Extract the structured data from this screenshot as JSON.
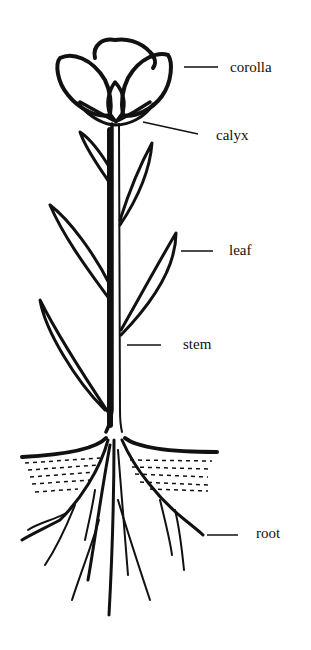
{
  "diagram": {
    "ink_color": "#111111",
    "background": "#ffffff",
    "labels": [
      {
        "id": "corolla",
        "text": "corolla",
        "x": 230,
        "y": 60,
        "line": [
          184,
          67,
          218,
          67
        ]
      },
      {
        "id": "calyx",
        "text": "calyx",
        "x": 216,
        "y": 128,
        "line": [
          143,
          122,
          198,
          134
        ]
      },
      {
        "id": "leaf",
        "text": "leaf",
        "x": 229,
        "y": 243,
        "line": [
          181,
          251,
          213,
          251
        ]
      },
      {
        "id": "stem",
        "text": "stem",
        "x": 183,
        "y": 337,
        "line": [
          127,
          345,
          161,
          345
        ]
      },
      {
        "id": "root",
        "text": "root",
        "x": 256,
        "y": 526,
        "line": [
          207,
          535,
          238,
          535
        ]
      }
    ]
  }
}
